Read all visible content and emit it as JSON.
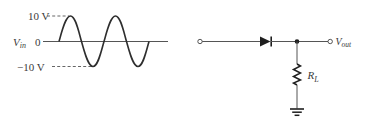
{
  "waveform": {
    "signal_label": "V",
    "signal_subscript": "in",
    "positive_peak_label": "10 V",
    "zero_label": "0",
    "negative_peak_label": "−10 V",
    "peak_voltage": 10,
    "cycles": 2
  },
  "circuit": {
    "diode_orientation": "anode-left cathode-right",
    "output_label": "V",
    "output_subscript": "out",
    "resistor_label": "R",
    "resistor_subscript": "L",
    "ground": "ground-icon"
  },
  "colors": {
    "stroke": "#3a3a3a",
    "background": "#ffffff"
  }
}
